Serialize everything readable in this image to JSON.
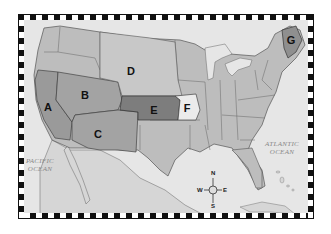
{
  "map": {
    "regions": [
      {
        "id": "A",
        "label": "A",
        "color": "#9a9a9a",
        "x": 43,
        "y": 106
      },
      {
        "id": "B",
        "label": "B",
        "color": "#a3a3a3",
        "x": 85,
        "y": 95
      },
      {
        "id": "C",
        "label": "C",
        "color": "#a3a3a3",
        "x": 98,
        "y": 131
      },
      {
        "id": "D",
        "label": "D",
        "color": "#c8c8c8",
        "x": 130,
        "y": 70
      },
      {
        "id": "E",
        "label": "E",
        "color": "#7d7d7d",
        "x": 154,
        "y": 108
      },
      {
        "id": "F",
        "label": "F",
        "color": "#ebebeb",
        "x": 186,
        "y": 108
      },
      {
        "id": "G",
        "label": "G",
        "color": "#8f8f8f",
        "x": 290,
        "y": 40
      }
    ],
    "oceans": [
      {
        "name": "pacific",
        "line1": "PACIFIC",
        "line2": "OCEAN"
      },
      {
        "name": "atlantic",
        "line1": "ATLANTIC",
        "line2": "OCEAN"
      }
    ],
    "compass": {
      "n": "N",
      "s": "S",
      "e": "E",
      "w": "W"
    },
    "colors": {
      "land": "#bdbdbd",
      "water": "#e6e6e6",
      "mexico": "#d6d6d6",
      "outline": "#555555"
    }
  }
}
